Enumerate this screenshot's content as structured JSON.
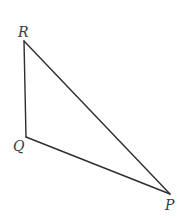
{
  "diagram": {
    "type": "triangle",
    "stroke_color": "#2e2e2e",
    "background": "#ffffff",
    "vertices": [
      {
        "name": "R",
        "x": 24,
        "y": 41
      },
      {
        "name": "Q",
        "x": 26,
        "y": 137
      },
      {
        "name": "P",
        "x": 170,
        "y": 194
      }
    ],
    "edges": [
      {
        "from": "R",
        "to": "Q"
      },
      {
        "from": "Q",
        "to": "P"
      },
      {
        "from": "P",
        "to": "R"
      }
    ],
    "labels": {
      "R": "R",
      "Q": "Q",
      "P": "P"
    }
  }
}
